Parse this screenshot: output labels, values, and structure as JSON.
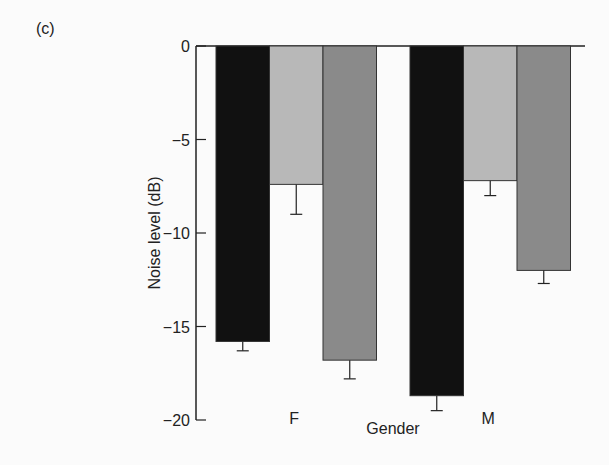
{
  "panel_label": "(c)",
  "chart_data": {
    "type": "bar",
    "title": "",
    "xlabel": "Gender",
    "ylabel": "Noise level (dB)",
    "ylim": [
      -20,
      0
    ],
    "yticks": [
      0,
      -5,
      -10,
      -15,
      -20
    ],
    "ytick_labels": [
      "0",
      "-5",
      "-10",
      "-15",
      "-20"
    ],
    "categories": [
      "F",
      "M"
    ],
    "grid": false,
    "legend": null,
    "series": [
      {
        "name": "series-1 (black)",
        "color": "#111111",
        "values": [
          -15.8,
          -18.7
        ],
        "error": [
          0.5,
          0.8
        ]
      },
      {
        "name": "series-2 (light gray)",
        "color": "#b8b8b8",
        "values": [
          -7.4,
          -7.2
        ],
        "error": [
          1.6,
          0.8
        ]
      },
      {
        "name": "series-3 (mid gray)",
        "color": "#8a8a8a",
        "values": [
          -16.8,
          -12.0
        ],
        "error": [
          1.0,
          0.7
        ]
      }
    ]
  }
}
